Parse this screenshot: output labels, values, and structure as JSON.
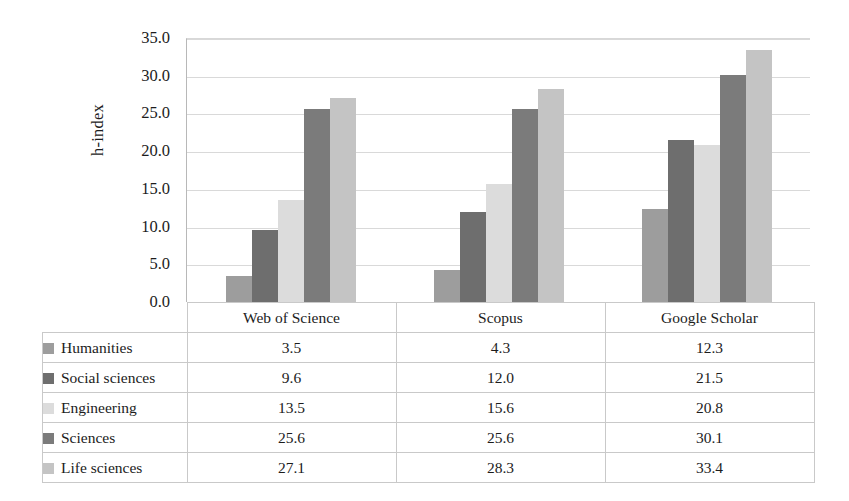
{
  "chart_data": {
    "type": "bar",
    "title": "",
    "xlabel": "",
    "ylabel": "h-index",
    "ylim": [
      0,
      35
    ],
    "ytick_step": 5,
    "grid": true,
    "legend_position": "table-below",
    "categories": [
      "Web of Science",
      "Scopus",
      "Google Scholar"
    ],
    "ytick_labels": [
      "35.0",
      "30.0",
      "25.0",
      "20.0",
      "15.0",
      "10.0",
      "5.0",
      "0.0"
    ],
    "ytick_values": [
      35,
      30,
      25,
      20,
      15,
      10,
      5,
      0
    ],
    "series": [
      {
        "name": "Humanities",
        "color": "#9d9d9d",
        "values": [
          3.5,
          4.3,
          12.3
        ]
      },
      {
        "name": "Social sciences",
        "color": "#6e6e6e",
        "values": [
          9.6,
          12.0,
          21.5
        ]
      },
      {
        "name": "Engineering",
        "color": "#dcdcdc",
        "values": [
          13.5,
          15.6,
          20.8
        ]
      },
      {
        "name": "Sciences",
        "color": "#7b7b7b",
        "values": [
          25.6,
          25.6,
          30.1
        ]
      },
      {
        "name": "Life sciences",
        "color": "#c4c4c4",
        "values": [
          27.1,
          28.3,
          33.4
        ]
      }
    ]
  },
  "table": {
    "header_blank": "",
    "columns": [
      "Web of Science",
      "Scopus",
      "Google Scholar"
    ],
    "rows": [
      {
        "label": "Humanities",
        "values": [
          "3.5",
          "4.3",
          "12.3"
        ]
      },
      {
        "label": "Social sciences",
        "values": [
          "9.6",
          "12.0",
          "21.5"
        ]
      },
      {
        "label": "Engineering",
        "values": [
          "13.5",
          "15.6",
          "20.8"
        ]
      },
      {
        "label": "Sciences",
        "values": [
          "25.6",
          "25.6",
          "30.1"
        ]
      },
      {
        "label": "Life sciences",
        "values": [
          "27.1",
          "28.3",
          "33.4"
        ]
      }
    ]
  },
  "colors": {
    "gridline": "#d9d9d9",
    "axis": "#9a9a9a",
    "table_border": "#c9c9c9",
    "text": "#1c1c1c",
    "background": "#ffffff"
  }
}
